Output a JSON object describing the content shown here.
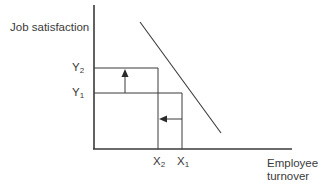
{
  "diagram": {
    "y_axis_label": "Job satisfaction",
    "x_axis_label_line1": "Employee",
    "x_axis_label_line2": "turnover",
    "y_ticks": [
      {
        "base": "Y",
        "sub": "2"
      },
      {
        "base": "Y",
        "sub": "1"
      }
    ],
    "x_ticks": [
      {
        "base": "X",
        "sub": "2"
      },
      {
        "base": "X",
        "sub": "1"
      }
    ],
    "line_color": "#3a3a3a",
    "relationship": "negative linear: higher job satisfaction corresponds to lower employee turnover",
    "arrows": [
      {
        "name": "satisfaction-increase",
        "direction": "up",
        "from": "Y1",
        "to": "Y2"
      },
      {
        "name": "turnover-decrease",
        "direction": "left",
        "from": "X1",
        "to": "X2"
      }
    ]
  }
}
